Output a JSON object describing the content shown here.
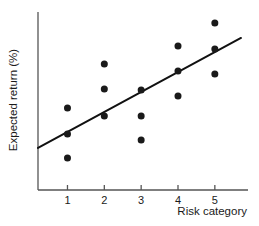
{
  "chart_data": {
    "type": "scatter",
    "title": "",
    "xlabel": "Risk category",
    "ylabel": "Expected return (%)",
    "xlim": [
      0.2,
      5.9
    ],
    "ylim": [
      0.0,
      1.0
    ],
    "xticks": [
      1,
      2,
      3,
      4,
      5
    ],
    "xtick_labels": [
      "1",
      "2",
      "3",
      "4",
      "5"
    ],
    "yticks": [],
    "ytick_labels": [],
    "grid": false,
    "legend": null,
    "y_axis_unlabeled": true,
    "marker": {
      "shape": "circle",
      "color": "#1a1a1a",
      "size_px": 7
    },
    "points": [
      {
        "x": 1,
        "y": 0.461
      },
      {
        "x": 1,
        "y": 0.315
      },
      {
        "x": 1,
        "y": 0.18
      },
      {
        "x": 2,
        "y": 0.708
      },
      {
        "x": 2,
        "y": 0.567
      },
      {
        "x": 2,
        "y": 0.416
      },
      {
        "x": 3,
        "y": 0.562
      },
      {
        "x": 3,
        "y": 0.416
      },
      {
        "x": 3,
        "y": 0.281
      },
      {
        "x": 4,
        "y": 0.809
      },
      {
        "x": 4,
        "y": 0.669
      },
      {
        "x": 4,
        "y": 0.528
      },
      {
        "x": 5,
        "y": 0.938
      },
      {
        "x": 5,
        "y": 0.792
      },
      {
        "x": 5,
        "y": 0.652
      }
    ],
    "trend_line": {
      "type": "linear-fit",
      "color": "#111111",
      "width_px": 2,
      "x_start": 0.2,
      "y_start": 0.236,
      "x_end": 5.71,
      "y_end": 0.854
    },
    "axes": {
      "line_color": "#555555",
      "line_width_px": 1.3,
      "tick_length_px": 5
    }
  }
}
